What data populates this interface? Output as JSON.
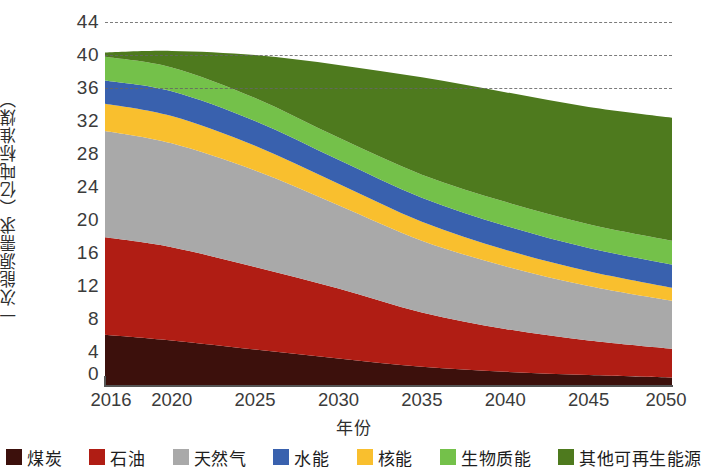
{
  "chart_data": {
    "type": "area",
    "title": "",
    "xlabel": "年份",
    "ylabel": "一次能源需求（亿吨标准煤）",
    "x": [
      2016,
      2020,
      2025,
      2030,
      2035,
      2040,
      2045,
      2050
    ],
    "xtick_labels": [
      "2016",
      "2020",
      "2025",
      "2030",
      "2035",
      "2040",
      "2045",
      "2050"
    ],
    "ytick_labels": [
      "44",
      "40",
      "36",
      "32",
      "28",
      "24",
      "20",
      "16",
      "12",
      "8",
      "4",
      "0"
    ],
    "ytick_values": [
      44,
      40,
      36,
      32,
      28,
      24,
      20,
      16,
      12,
      8,
      4,
      0
    ],
    "ylim": [
      0,
      44
    ],
    "xlim": [
      2016,
      2050
    ],
    "grid": true,
    "grid_style": "dashed horizontal",
    "stacked": true,
    "legend_position": "bottom",
    "series": [
      {
        "name": "煤炭",
        "color": "#3c100c",
        "values": [
          6.1,
          5.4,
          4.3,
          3.2,
          2.2,
          1.6,
          1.2,
          0.9
        ]
      },
      {
        "name": "石油",
        "color": "#b01d14",
        "values": [
          11.8,
          11.3,
          10.0,
          8.5,
          6.6,
          5.2,
          4.2,
          3.5
        ]
      },
      {
        "name": "天然气",
        "color": "#a9a9a9",
        "values": [
          12.9,
          12.6,
          11.7,
          10.1,
          8.7,
          7.6,
          6.6,
          5.8
        ]
      },
      {
        "name": "核能",
        "color": "#f9bf2e",
        "values": [
          3.3,
          3.3,
          3.0,
          2.6,
          2.3,
          2.0,
          1.8,
          1.6
        ]
      },
      {
        "name": "水能",
        "color": "#3961ae",
        "values": [
          2.8,
          3.0,
          3.0,
          2.9,
          2.9,
          2.9,
          2.8,
          2.8
        ]
      },
      {
        "name": "生物质能",
        "color": "#74c14a",
        "values": [
          2.9,
          2.9,
          2.8,
          2.7,
          2.8,
          2.9,
          2.9,
          2.9
        ]
      },
      {
        "name": "其他可再生能源",
        "color": "#4e7a1e",
        "values": [
          0.5,
          2.0,
          5.2,
          8.8,
          11.8,
          13.3,
          14.2,
          14.9
        ]
      }
    ]
  },
  "legend": {
    "items": [
      {
        "label": "煤炭",
        "color": "#3c100c"
      },
      {
        "label": "石油",
        "color": "#b01d14"
      },
      {
        "label": "天然气",
        "color": "#a9a9a9"
      },
      {
        "label": "水能",
        "color": "#3961ae"
      },
      {
        "label": "核能",
        "color": "#f9bf2e"
      },
      {
        "label": "生物质能",
        "color": "#74c14a"
      },
      {
        "label": "其他可再生能源",
        "color": "#4e7a1e"
      }
    ]
  }
}
